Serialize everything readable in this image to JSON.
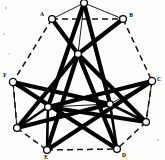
{
  "figure": {
    "background_color": "#fdfdfb",
    "ink_color": "#000000",
    "width": 165,
    "height": 160
  },
  "nodes": [
    {
      "id": "T",
      "label": "",
      "x": 84,
      "y": 3,
      "r": 3.4,
      "label_dx": 0,
      "label_dy": 0
    },
    {
      "id": "A",
      "label": "A",
      "x": 52,
      "y": 19,
      "r": 3.4,
      "label_dx": -10,
      "label_dy": -4
    },
    {
      "id": "B",
      "label": "B",
      "x": 123,
      "y": 19,
      "r": 3.4,
      "label_dx": 8,
      "label_dy": -3
    },
    {
      "id": "F",
      "label": "F",
      "x": 13,
      "y": 82,
      "r": 3.6,
      "label_dx": -8,
      "label_dy": -6
    },
    {
      "id": "C",
      "label": "C",
      "x": 152,
      "y": 81,
      "r": 3.6,
      "label_dx": 7,
      "label_dy": -1
    },
    {
      "id": "L1",
      "label": "",
      "x": 17,
      "y": 128,
      "r": 3.4,
      "label_dx": 0,
      "label_dy": 0
    },
    {
      "id": "R1",
      "label": "",
      "x": 146,
      "y": 122,
      "r": 3.4,
      "label_dx": 0,
      "label_dy": 0
    },
    {
      "id": "E",
      "label": "E",
      "x": 47,
      "y": 150,
      "r": 3.4,
      "label_dx": -1,
      "label_dy": 8
    },
    {
      "id": "D",
      "label": "D",
      "x": 117,
      "y": 149,
      "r": 3.4,
      "label_dx": 7,
      "label_dy": 7
    },
    {
      "id": "M",
      "label": "",
      "x": 78,
      "y": 54,
      "r": 3.4,
      "label_dx": 0,
      "label_dy": 0
    },
    {
      "id": "IL",
      "label": "",
      "x": 48,
      "y": 107,
      "r": 3.4,
      "label_dx": 0,
      "label_dy": 0
    },
    {
      "id": "IR",
      "label": "",
      "x": 110,
      "y": 104,
      "r": 3.2,
      "label_dx": 0,
      "label_dy": 0
    }
  ],
  "edges_dashed": [
    {
      "from": "A",
      "to": "B"
    },
    {
      "from": "A",
      "to": "F"
    },
    {
      "from": "B",
      "to": "C"
    },
    {
      "from": "F",
      "to": "L1"
    },
    {
      "from": "C",
      "to": "R1"
    },
    {
      "from": "L1",
      "to": "E"
    },
    {
      "from": "R1",
      "to": "D"
    },
    {
      "from": "E",
      "to": "D"
    }
  ],
  "edges_thin": [
    {
      "from": "T",
      "to": "A"
    },
    {
      "from": "T",
      "to": "B"
    },
    {
      "from": "T",
      "to": "M"
    },
    {
      "from": "A",
      "to": "M"
    },
    {
      "from": "B",
      "to": "M"
    },
    {
      "from": "F",
      "to": "IL"
    },
    {
      "from": "C",
      "to": "IR"
    },
    {
      "from": "L1",
      "to": "IL"
    },
    {
      "from": "R1",
      "to": "IR"
    },
    {
      "from": "E",
      "to": "IL"
    },
    {
      "from": "D",
      "to": "IR"
    },
    {
      "from": "IL",
      "to": "IR"
    },
    {
      "from": "F",
      "to": "L1"
    },
    {
      "from": "C",
      "to": "R1"
    }
  ],
  "edges_thick": [
    {
      "from": "T",
      "to": "IL"
    },
    {
      "from": "T",
      "to": "IR"
    },
    {
      "from": "A",
      "to": "M"
    },
    {
      "from": "B",
      "to": "M"
    },
    {
      "from": "F",
      "to": "IR"
    },
    {
      "from": "C",
      "to": "IL"
    },
    {
      "from": "F",
      "to": "D"
    },
    {
      "from": "C",
      "to": "E"
    },
    {
      "from": "M",
      "to": "E"
    },
    {
      "from": "M",
      "to": "D"
    },
    {
      "from": "L1",
      "to": "M"
    },
    {
      "from": "R1",
      "to": "M"
    },
    {
      "from": "IL",
      "to": "R1"
    },
    {
      "from": "IR",
      "to": "L1"
    }
  ],
  "edges_medium": [
    {
      "from": "E",
      "to": "IL"
    },
    {
      "from": "D",
      "to": "IR"
    },
    {
      "from": "L1",
      "to": "IL"
    },
    {
      "from": "R1",
      "to": "IR"
    }
  ],
  "specks": [
    {
      "x": 6,
      "y": 8,
      "r": 1.2
    },
    {
      "x": 4,
      "y": 34,
      "r": 0.9
    },
    {
      "x": 9,
      "y": 54,
      "r": 0.8
    },
    {
      "x": 158,
      "y": 140,
      "r": 0.9
    }
  ]
}
